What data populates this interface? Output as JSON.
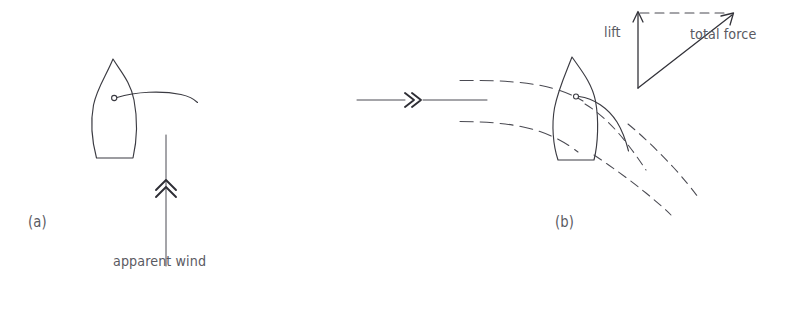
{
  "figure": {
    "type": "diagram",
    "background_color": "#ffffff",
    "ink_color": "#3b3b42",
    "text_color": "#5a5a62"
  },
  "panels": [
    {
      "id": "a",
      "label": "(a)",
      "label_x": 28,
      "label_y": 222,
      "description": "boat at rest with sail and vertical apparent wind arrow",
      "boat": {
        "name": "sailboat-plan-view",
        "bow_x": 113,
        "bow_y": 59,
        "stern_y": 159,
        "mast_x": 114,
        "mast_y": 98
      },
      "wind_arrow": {
        "name": "apparent-wind-arrow",
        "label": "apparent wind",
        "label_x": 113,
        "label_y": 262,
        "x": 166,
        "y_tail": 266,
        "y_head": 135,
        "chevron_y": 186,
        "chevron_count": 2,
        "direction": "up"
      }
    },
    {
      "id": "b",
      "label": "(b)",
      "label_x": 555,
      "label_y": 222,
      "description": "boat sailing with airflow streamlines deflected by the sail and a force vector triangle",
      "boat": {
        "name": "sailboat-plan-view",
        "bow_x": 572,
        "bow_y": 57,
        "stern_y": 160,
        "mast_x": 576,
        "mast_y": 97
      },
      "wind_arrow": {
        "name": "incoming-wind-arrow",
        "x_tail": 357,
        "x_head": 487,
        "y": 100,
        "chevron_x": 412,
        "chevron_count": 2,
        "direction": "right"
      },
      "streamlines": {
        "name": "airflow-streamlines",
        "upstream_count": 2,
        "downstream_count": 3,
        "style": "dashed"
      },
      "force_triangle": {
        "name": "force-vector-triangle",
        "apex_x": 638,
        "apex_y": 12,
        "origin_x": 638,
        "origin_y": 88,
        "tip_x": 733,
        "tip_y": 14,
        "vectors": [
          {
            "name": "lift-vector",
            "label": "lift",
            "label_x": 604,
            "label_y": 31,
            "direction": "up",
            "style": "solid-arrow"
          },
          {
            "name": "total-force-vector",
            "label": "total force",
            "label_x": 690,
            "label_y": 33,
            "direction": "up-right",
            "style": "solid-arrow"
          },
          {
            "name": "drag-component-line",
            "label": "",
            "direction": "right",
            "style": "dashed"
          }
        ]
      }
    }
  ]
}
